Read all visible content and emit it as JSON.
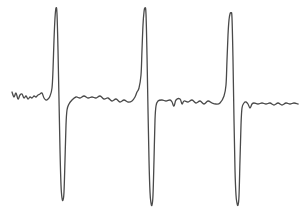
{
  "chart_data": {
    "type": "line",
    "title": "",
    "xlabel": "",
    "ylabel": "",
    "grid": false,
    "axes_visible": false,
    "legend": [],
    "style": {
      "line_color": "#4a4a4a",
      "line_width": 1.3,
      "background": "#ffffff"
    },
    "xlim": [
      0,
      305
    ],
    "ylim": [
      215,
      0
    ],
    "features": [
      {
        "peak_x": 56,
        "peak_y": 8,
        "trough_x": 63,
        "trough_y": 200
      },
      {
        "peak_x": 145,
        "peak_y": 8,
        "trough_x": 152,
        "trough_y": 205
      },
      {
        "peak_x": 231,
        "peak_y": 13,
        "trough_x": 238,
        "trough_y": 205
      }
    ],
    "series": [
      {
        "name": "signal",
        "points": [
          [
            12,
            92
          ],
          [
            14,
            97
          ],
          [
            16,
            93
          ],
          [
            18,
            99
          ],
          [
            20,
            95
          ],
          [
            22,
            94
          ],
          [
            24,
            98
          ],
          [
            26,
            96
          ],
          [
            28,
            99
          ],
          [
            30,
            97
          ],
          [
            32,
            98
          ],
          [
            34,
            96
          ],
          [
            36,
            97
          ],
          [
            38,
            95
          ],
          [
            40,
            94
          ],
          [
            42,
            93
          ],
          [
            44,
            98
          ],
          [
            46,
            100
          ],
          [
            48,
            99
          ],
          [
            50,
            96
          ],
          [
            52,
            88
          ],
          [
            53,
            70
          ],
          [
            54,
            40
          ],
          [
            55,
            18
          ],
          [
            56,
            8
          ],
          [
            57,
            14
          ],
          [
            58,
            50
          ],
          [
            59,
            100
          ],
          [
            60,
            150
          ],
          [
            61,
            185
          ],
          [
            62,
            198
          ],
          [
            63,
            200
          ],
          [
            64,
            192
          ],
          [
            65,
            160
          ],
          [
            66,
            125
          ],
          [
            67,
            110
          ],
          [
            69,
            104
          ],
          [
            72,
            100
          ],
          [
            76,
            97
          ],
          [
            80,
            98
          ],
          [
            84,
            96
          ],
          [
            88,
            98
          ],
          [
            92,
            97
          ],
          [
            96,
            98
          ],
          [
            100,
            96
          ],
          [
            104,
            99
          ],
          [
            108,
            98
          ],
          [
            112,
            101
          ],
          [
            116,
            99
          ],
          [
            120,
            102
          ],
          [
            124,
            100
          ],
          [
            128,
            102
          ],
          [
            132,
            101
          ],
          [
            135,
            97
          ],
          [
            137,
            92
          ],
          [
            139,
            88
          ],
          [
            141,
            75
          ],
          [
            142,
            50
          ],
          [
            143,
            25
          ],
          [
            144,
            12
          ],
          [
            145,
            8
          ],
          [
            146,
            14
          ],
          [
            147,
            55
          ],
          [
            148,
            110
          ],
          [
            149,
            160
          ],
          [
            150,
            192
          ],
          [
            151,
            203
          ],
          [
            152,
            205
          ],
          [
            153,
            195
          ],
          [
            154,
            160
          ],
          [
            155,
            120
          ],
          [
            156,
            106
          ],
          [
            158,
            101
          ],
          [
            162,
            100
          ],
          [
            166,
            101
          ],
          [
            170,
            100
          ],
          [
            172,
            102
          ],
          [
            174,
            106
          ],
          [
            176,
            100
          ],
          [
            180,
            99
          ],
          [
            182,
            104
          ],
          [
            184,
            101
          ],
          [
            188,
            102
          ],
          [
            192,
            100
          ],
          [
            196,
            103
          ],
          [
            200,
            101
          ],
          [
            204,
            104
          ],
          [
            208,
            101
          ],
          [
            212,
            103
          ],
          [
            216,
            104
          ],
          [
            220,
            103
          ],
          [
            224,
            96
          ],
          [
            226,
            85
          ],
          [
            227,
            60
          ],
          [
            228,
            35
          ],
          [
            229,
            20
          ],
          [
            230,
            14
          ],
          [
            231,
            13
          ],
          [
            232,
            18
          ],
          [
            233,
            60
          ],
          [
            234,
            120
          ],
          [
            235,
            170
          ],
          [
            236,
            195
          ],
          [
            237,
            203
          ],
          [
            238,
            205
          ],
          [
            239,
            196
          ],
          [
            240,
            160
          ],
          [
            241,
            125
          ],
          [
            242,
            108
          ],
          [
            244,
            103
          ],
          [
            246,
            102
          ],
          [
            248,
            104
          ],
          [
            250,
            108
          ],
          [
            252,
            104
          ],
          [
            254,
            103
          ],
          [
            258,
            104
          ],
          [
            262,
            103
          ],
          [
            266,
            104
          ],
          [
            270,
            103
          ],
          [
            274,
            105
          ],
          [
            278,
            103
          ],
          [
            282,
            105
          ],
          [
            286,
            103
          ],
          [
            290,
            104
          ],
          [
            294,
            103
          ],
          [
            298,
            104
          ]
        ]
      }
    ]
  }
}
